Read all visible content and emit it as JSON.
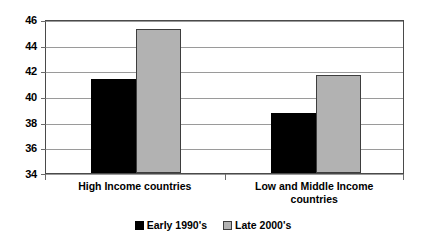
{
  "chart_data": {
    "type": "bar",
    "title": "",
    "subtitle": "",
    "xlabel": "",
    "ylabel": "",
    "categories": [
      "High Income countries",
      "Low and Middle Income countries"
    ],
    "series": [
      {
        "name": "Early 1990's",
        "values": [
          41.4,
          38.7
        ],
        "color": "#000000"
      },
      {
        "name": "Late 2000's",
        "values": [
          45.3,
          41.7
        ],
        "color": "#b2b2b2"
      }
    ],
    "ylim": [
      34,
      46
    ],
    "yticks": [
      34,
      36,
      38,
      40,
      42,
      44,
      46
    ],
    "ytick_labels": [
      "34",
      "36",
      "38",
      "40",
      "42",
      "44",
      "46"
    ],
    "grid": true,
    "grid_axis": "y",
    "legend": true,
    "legend_position": "bottom",
    "annotations": []
  },
  "axis": {
    "y_tick_labels": [
      "46",
      "44",
      "42",
      "40",
      "38",
      "36",
      "34"
    ]
  },
  "legend": {
    "entries": [
      {
        "label": "Early 1990's"
      },
      {
        "label": "Late 2000's"
      }
    ]
  },
  "categories": {
    "labels": [
      {
        "line1": "High Income countries",
        "line2": ""
      },
      {
        "line1": "Low and Middle Income",
        "line2": "countries"
      }
    ]
  }
}
